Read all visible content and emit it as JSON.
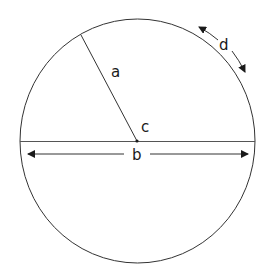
{
  "diagram": {
    "colors": {
      "stroke": "#333333",
      "text": "#1a1a1a",
      "background": "#ffffff"
    },
    "labels": {
      "radius": "a",
      "diameter": "b",
      "center": "c",
      "circumference": "d"
    },
    "elements": [
      {
        "id": "radius",
        "label": "a",
        "meaning": "radius line from center to circle edge"
      },
      {
        "id": "diameter",
        "label": "b",
        "meaning": "horizontal diameter with double-headed arrow"
      },
      {
        "id": "center",
        "label": "c",
        "meaning": "center point"
      },
      {
        "id": "circumference",
        "label": "d",
        "meaning": "arc arrow along circumference"
      }
    ]
  }
}
